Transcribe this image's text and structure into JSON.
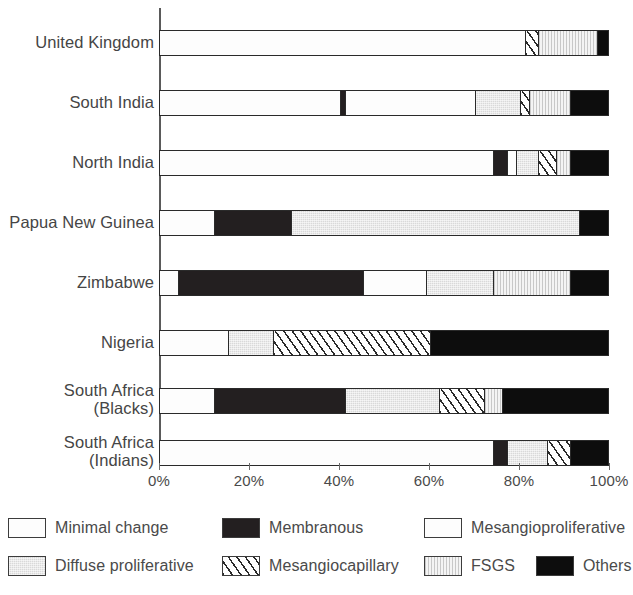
{
  "chart_data": {
    "type": "bar",
    "orientation": "horizontal",
    "stacked": true,
    "normalized_percent": true,
    "title": "",
    "xlabel": "",
    "ylabel": "",
    "xlim": [
      0,
      100
    ],
    "grid": false,
    "legend_position": "bottom",
    "axis_ticks": [
      "0%",
      "20%",
      "40%",
      "60%",
      "80%",
      "100%"
    ],
    "axis_tick_values": [
      0,
      20,
      40,
      60,
      80,
      100
    ],
    "categories": [
      "United Kingdom",
      "South India",
      "North India",
      "Papua New Guinea",
      "Zimbabwe",
      "Nigeria",
      "South Africa (Blacks)",
      "South Africa (Indians)"
    ],
    "series": [
      {
        "name": "Minimal change",
        "fill": "white",
        "values": [
          0,
          40,
          0,
          12,
          4,
          15,
          12,
          0
        ]
      },
      {
        "name": "Membranous",
        "fill": "dark",
        "values": [
          0,
          1,
          3,
          17,
          41,
          0,
          29,
          3
        ]
      },
      {
        "name": "Mesangioproliferative",
        "fill": "white",
        "values": [
          81,
          29,
          74,
          0,
          14,
          0,
          0,
          74
        ]
      },
      {
        "name": "Diffuse proliferative",
        "fill": "gray",
        "values": [
          0,
          10,
          5,
          64,
          15,
          10,
          21,
          9
        ]
      },
      {
        "name": "Mesangiocapillary",
        "fill": "diagonal-hatch",
        "values": [
          3,
          2,
          4,
          0,
          0,
          35,
          10,
          5
        ]
      },
      {
        "name": "FSGS",
        "fill": "fine-vertical-hatch",
        "values": [
          13,
          9,
          3,
          0,
          17,
          0,
          4,
          0
        ]
      },
      {
        "name": "Others",
        "fill": "black",
        "values": [
          3,
          9,
          11,
          7,
          9,
          40,
          24,
          9
        ]
      }
    ],
    "bars": [
      {
        "category": "United Kingdom",
        "label_lines": [
          "United Kingdom"
        ],
        "segments": [
          {
            "name": "Mesangioproliferative",
            "fill": "white",
            "start": 0,
            "end": 81,
            "value": 81
          },
          {
            "name": "Mesangiocapillary",
            "fill": "hatch",
            "start": 81,
            "end": 84,
            "value": 3
          },
          {
            "name": "FSGS",
            "fill": "fsgs",
            "start": 84,
            "end": 97,
            "value": 13
          },
          {
            "name": "Others",
            "fill": "black",
            "start": 97,
            "end": 100,
            "value": 3
          }
        ]
      },
      {
        "category": "South India",
        "label_lines": [
          "South India"
        ],
        "segments": [
          {
            "name": "Minimal change",
            "fill": "white",
            "start": 0,
            "end": 40,
            "value": 40
          },
          {
            "name": "Membranous",
            "fill": "dark",
            "start": 40,
            "end": 41,
            "value": 1
          },
          {
            "name": "Mesangioproliferative",
            "fill": "white",
            "start": 41,
            "end": 70,
            "value": 29
          },
          {
            "name": "Diffuse proliferative",
            "fill": "gray",
            "start": 70,
            "end": 80,
            "value": 10
          },
          {
            "name": "Mesangiocapillary",
            "fill": "hatch",
            "start": 80,
            "end": 82,
            "value": 2
          },
          {
            "name": "FSGS",
            "fill": "fsgs",
            "start": 82,
            "end": 91,
            "value": 9
          },
          {
            "name": "Others",
            "fill": "black",
            "start": 91,
            "end": 100,
            "value": 9
          }
        ]
      },
      {
        "category": "North India",
        "label_lines": [
          "North India"
        ],
        "segments": [
          {
            "name": "Mesangioproliferative",
            "fill": "white",
            "start": 0,
            "end": 74,
            "value": 74
          },
          {
            "name": "Membranous",
            "fill": "dark",
            "start": 74,
            "end": 77,
            "value": 3
          },
          {
            "name": "Minimal change",
            "fill": "white",
            "start": 77,
            "end": 79,
            "value": 2
          },
          {
            "name": "Diffuse proliferative",
            "fill": "gray",
            "start": 79,
            "end": 84,
            "value": 5
          },
          {
            "name": "Mesangiocapillary",
            "fill": "hatch",
            "start": 84,
            "end": 88,
            "value": 4
          },
          {
            "name": "FSGS",
            "fill": "fsgs",
            "start": 88,
            "end": 91,
            "value": 3
          },
          {
            "name": "Others",
            "fill": "black",
            "start": 91,
            "end": 100,
            "value": 9
          }
        ]
      },
      {
        "category": "Papua New Guinea",
        "label_lines": [
          "Papua New Guinea"
        ],
        "segments": [
          {
            "name": "Minimal change",
            "fill": "white",
            "start": 0,
            "end": 12,
            "value": 12
          },
          {
            "name": "Membranous",
            "fill": "dark",
            "start": 12,
            "end": 29,
            "value": 17
          },
          {
            "name": "Diffuse proliferative",
            "fill": "gray",
            "start": 29,
            "end": 93,
            "value": 64
          },
          {
            "name": "Others",
            "fill": "black",
            "start": 93,
            "end": 100,
            "value": 7
          }
        ]
      },
      {
        "category": "Zimbabwe",
        "label_lines": [
          "Zimbabwe"
        ],
        "segments": [
          {
            "name": "Minimal change",
            "fill": "white",
            "start": 0,
            "end": 4,
            "value": 4
          },
          {
            "name": "Membranous",
            "fill": "dark",
            "start": 4,
            "end": 45,
            "value": 41
          },
          {
            "name": "Mesangioproliferative",
            "fill": "white",
            "start": 45,
            "end": 59,
            "value": 14
          },
          {
            "name": "Diffuse proliferative",
            "fill": "gray",
            "start": 59,
            "end": 74,
            "value": 15
          },
          {
            "name": "FSGS",
            "fill": "fsgs",
            "start": 74,
            "end": 91,
            "value": 17
          },
          {
            "name": "Others",
            "fill": "black",
            "start": 91,
            "end": 100,
            "value": 9
          }
        ]
      },
      {
        "category": "Nigeria",
        "label_lines": [
          "Nigeria"
        ],
        "segments": [
          {
            "name": "Minimal change",
            "fill": "white",
            "start": 0,
            "end": 15,
            "value": 15
          },
          {
            "name": "Diffuse proliferative",
            "fill": "gray",
            "start": 15,
            "end": 25,
            "value": 10
          },
          {
            "name": "Mesangiocapillary",
            "fill": "hatch",
            "start": 25,
            "end": 60,
            "value": 35
          },
          {
            "name": "Others",
            "fill": "black",
            "start": 60,
            "end": 100,
            "value": 40
          }
        ]
      },
      {
        "category": "South Africa (Blacks)",
        "label_lines": [
          "South Africa",
          "(Blacks)"
        ],
        "segments": [
          {
            "name": "Minimal change",
            "fill": "white",
            "start": 0,
            "end": 12,
            "value": 12
          },
          {
            "name": "Membranous",
            "fill": "dark",
            "start": 12,
            "end": 41,
            "value": 29
          },
          {
            "name": "Diffuse proliferative",
            "fill": "gray",
            "start": 41,
            "end": 62,
            "value": 21
          },
          {
            "name": "Mesangiocapillary",
            "fill": "hatch",
            "start": 62,
            "end": 72,
            "value": 10
          },
          {
            "name": "FSGS",
            "fill": "fsgs",
            "start": 72,
            "end": 76,
            "value": 4
          },
          {
            "name": "Others",
            "fill": "black",
            "start": 76,
            "end": 100,
            "value": 24
          }
        ]
      },
      {
        "category": "South Africa (Indians)",
        "label_lines": [
          "South Africa",
          "(Indians)"
        ],
        "segments": [
          {
            "name": "Mesangioproliferative",
            "fill": "white",
            "start": 0,
            "end": 74,
            "value": 74
          },
          {
            "name": "Membranous",
            "fill": "dark",
            "start": 74,
            "end": 77,
            "value": 3
          },
          {
            "name": "Diffuse proliferative",
            "fill": "gray",
            "start": 77,
            "end": 86,
            "value": 9
          },
          {
            "name": "Mesangiocapillary",
            "fill": "hatch",
            "start": 86,
            "end": 91,
            "value": 5
          },
          {
            "name": "Others",
            "fill": "black",
            "start": 91,
            "end": 100,
            "value": 9
          }
        ]
      }
    ],
    "legend": [
      {
        "label": "Minimal change",
        "fill": "white"
      },
      {
        "label": "Membranous",
        "fill": "dark"
      },
      {
        "label": "Mesangioproliferative",
        "fill": "white"
      },
      {
        "label": "Diffuse proliferative",
        "fill": "gray"
      },
      {
        "label": "Mesangiocapillary",
        "fill": "hatch"
      },
      {
        "label": "FSGS",
        "fill": "fsgs"
      },
      {
        "label": "Others",
        "fill": "black"
      }
    ]
  },
  "colors": {
    "outline": "#2a2a2a",
    "dark_fill": "#231f20",
    "black_fill": "#0d0d0d",
    "gray_fill": "#d9d9d9",
    "fsgs_fill": "#ededed",
    "white_fill": "#fdfdfd",
    "text": "#454545",
    "axis": "#5a5a5a"
  }
}
